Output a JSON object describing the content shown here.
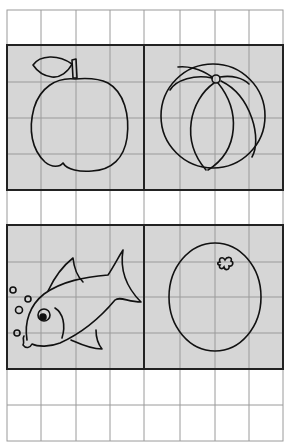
{
  "worksheet": {
    "title": "",
    "grid": {
      "left": 7,
      "right": 283,
      "top": 10,
      "bottom": 441,
      "columns": 8,
      "line_color": "#9a9a9a",
      "border_color": "#222222",
      "panel_fill": "#d6d6d6",
      "paper_color": "#ffffff"
    },
    "panels": [
      {
        "id": "apple",
        "label": "apple",
        "row": 0,
        "col": 0
      },
      {
        "id": "ball",
        "label": "ball",
        "row": 0,
        "col": 1
      },
      {
        "id": "fish",
        "label": "fish",
        "row": 1,
        "col": 0
      },
      {
        "id": "orange",
        "label": "orange",
        "row": 1,
        "col": 1
      }
    ],
    "empty_rows": [
      "top-strip",
      "middle-strip",
      "bottom-strip"
    ]
  }
}
